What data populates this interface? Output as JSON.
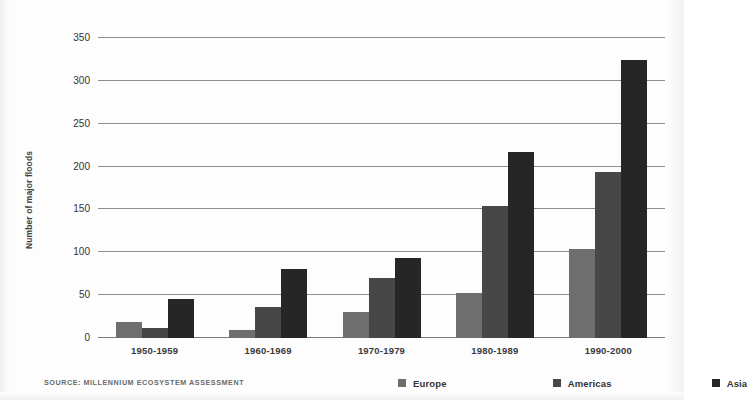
{
  "chart_data": {
    "type": "bar",
    "title": "",
    "subtitle": "",
    "xlabel": "",
    "ylabel": "Number of major floods",
    "categories": [
      "1950-1959",
      "1960-1969",
      "1970-1979",
      "1980-1989",
      "1990-2000"
    ],
    "series": [
      {
        "name": "Europe",
        "color": "#6e6e6e",
        "values": [
          19,
          9,
          30,
          53,
          104
        ]
      },
      {
        "name": "Americas",
        "color": "#474747",
        "values": [
          12,
          36,
          70,
          154,
          194
        ]
      },
      {
        "name": "Asia",
        "color": "#262626",
        "values": [
          45,
          81,
          93,
          217,
          324
        ]
      }
    ],
    "ylim": [
      0,
      350
    ],
    "yticks": [
      0,
      50,
      100,
      150,
      200,
      250,
      300,
      350
    ],
    "ytick_labels": [
      "0",
      "50",
      "100",
      "150",
      "200",
      "250",
      "300",
      "350"
    ],
    "grid": true,
    "legend_position": "bottom-right",
    "source_note": "SOURCE: MILLENNIUM ECOSYSTEM ASSESSMENT"
  }
}
